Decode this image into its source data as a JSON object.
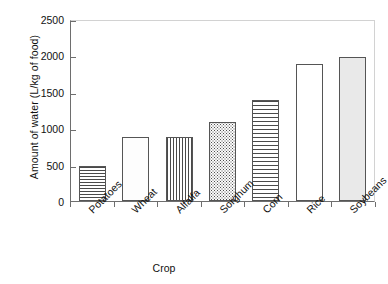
{
  "chart_data": {
    "type": "bar",
    "title": "",
    "subtitle": "",
    "xlabel": "Crop",
    "ylabel": "Amount of water (L/kg of food)",
    "categories": [
      "Potatoes",
      "Wheat",
      "Alfalfa",
      "Sorghum",
      "Corn",
      "Rice",
      "Soybeans"
    ],
    "values": [
      480,
      880,
      880,
      1090,
      1390,
      1880,
      1980
    ],
    "series": [
      {
        "name": "Amount of water",
        "values": [
          480,
          880,
          880,
          1090,
          1390,
          1880,
          1980
        ]
      }
    ],
    "ylim": [
      0,
      2500
    ],
    "yticks": [
      0,
      500,
      1000,
      1500,
      2000,
      2500
    ],
    "ytick_labels": [
      "0",
      "500",
      "1000",
      "1500",
      "2000",
      "2500"
    ],
    "grid": false,
    "legend": "none",
    "bar_patterns": [
      "horizontal-lines",
      "light-dots",
      "vertical-lines",
      "dense-dots",
      "crosshatch-grid",
      "empty-white",
      "solid-light-gray"
    ]
  },
  "colors": {
    "background": "#ffffff",
    "axis": "#6e6e6e",
    "frame_light": "#d2d2d2",
    "bar_outline": "#555555",
    "pattern_ink": "#4a4a4a",
    "soybeans_fill": "#e9e9e9",
    "text": "#111111"
  }
}
